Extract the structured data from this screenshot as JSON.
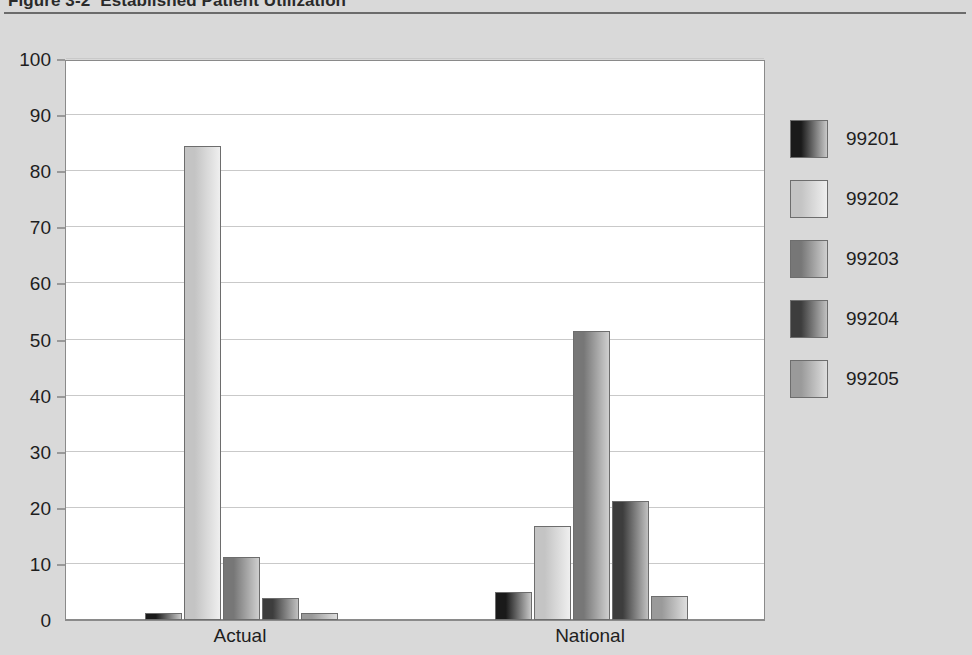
{
  "figure": {
    "number": "Figure 3-2",
    "caption": "Established Patient Utilization"
  },
  "colors": {
    "page_background": "#d9d9d9",
    "plot_background": "#ffffff",
    "gridline": "#c9c9c9",
    "axis": "#8a8a8a",
    "text": "#1e1e1e"
  },
  "chart_data": {
    "type": "bar",
    "xlabel": "",
    "ylabel": "",
    "categories": [
      "Actual",
      "National"
    ],
    "series": [
      {
        "name": "99201",
        "values": [
          1.2,
          5.0
        ],
        "color_dark": "#1a1a1a",
        "color_light": "#c8c8c8"
      },
      {
        "name": "99202",
        "values": [
          84.5,
          16.7
        ],
        "color_dark": "#c4c4c4",
        "color_light": "#efefef"
      },
      {
        "name": "99203",
        "values": [
          11.3,
          51.5
        ],
        "color_dark": "#777777",
        "color_light": "#cfcfcf"
      },
      {
        "name": "99204",
        "values": [
          4.0,
          21.3
        ],
        "color_dark": "#3d3d3d",
        "color_light": "#c0c0c0"
      },
      {
        "name": "99205",
        "values": [
          1.2,
          4.3
        ],
        "color_dark": "#9a9a9a",
        "color_light": "#dedede"
      }
    ],
    "ylim": [
      0,
      100
    ],
    "yticks": [
      0,
      10,
      20,
      30,
      40,
      50,
      60,
      70,
      80,
      90,
      100
    ],
    "ytick_labels": [
      "0",
      "10",
      "20",
      "30",
      "40",
      "50",
      "60",
      "70",
      "80",
      "90",
      "100"
    ],
    "grid": true,
    "legend_position": "right"
  }
}
